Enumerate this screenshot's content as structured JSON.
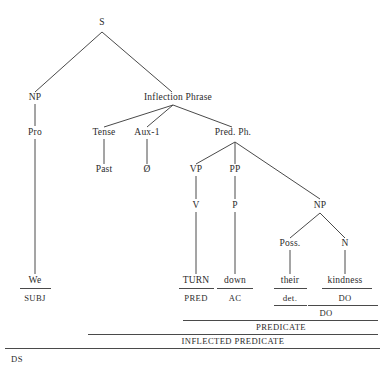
{
  "diagram": {
    "sentence": "We TURN down their kindness",
    "line_color": "#4a4a4a",
    "text_color": "#2b2b2b",
    "background": "#ffffff"
  },
  "nodes": {
    "s": "S",
    "np_subject": "NP",
    "inflection_phrase": "Inflection Phrase",
    "pro": "Pro",
    "tense": "Tense",
    "aux1": "Aux-1",
    "pred_ph": "Pred. Ph.",
    "past": "Past",
    "zero": "Ø",
    "vp": "VP",
    "pp": "PP",
    "np_object": "NP",
    "v": "V",
    "p": "P",
    "poss": "Poss.",
    "n": "N"
  },
  "terminals": {
    "we": "We",
    "turn": "TURN",
    "down": "down",
    "their": "their",
    "kindness": "kindness"
  },
  "functions": {
    "subj": "SUBJ",
    "pred": "PRED",
    "ac": "AC",
    "det": "det.",
    "do_inner": "DO",
    "do_outer": "DO",
    "predicate": "PREDICATE",
    "inflected_predicate": "INFLECTED PREDICATE",
    "ds": "DS"
  }
}
